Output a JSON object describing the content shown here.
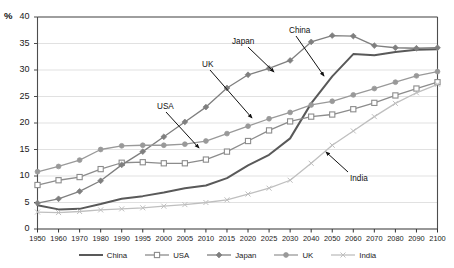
{
  "chart_data": {
    "type": "line",
    "title": "",
    "subtitle": "",
    "xlabel": "",
    "ylabel": "%",
    "ylim": [
      0,
      40
    ],
    "yticks": [
      0,
      5,
      10,
      15,
      20,
      25,
      30,
      35,
      40
    ],
    "grid": true,
    "legend_position": "bottom",
    "categories": [
      "1950",
      "1960",
      "1970",
      "1980",
      "1990",
      "1995",
      "2000",
      "2005",
      "2010",
      "2015",
      "2020",
      "2025",
      "2030",
      "2040",
      "2050",
      "2060",
      "2070",
      "2080",
      "2090",
      "2100"
    ],
    "series": [
      {
        "name": "China",
        "color": "#595959",
        "marker": "none",
        "values": [
          4.5,
          3.7,
          3.8,
          4.7,
          5.7,
          6.2,
          6.9,
          7.7,
          8.2,
          9.6,
          12.0,
          14.0,
          17.1,
          23.7,
          28.8,
          33.0,
          32.8,
          33.4,
          33.8,
          33.9
        ]
      },
      {
        "name": "USA",
        "color": "#8c8c8c",
        "marker": "open-square",
        "values": [
          8.3,
          9.2,
          9.8,
          11.3,
          12.5,
          12.6,
          12.4,
          12.4,
          13.1,
          14.6,
          16.6,
          18.6,
          20.3,
          21.2,
          21.6,
          22.6,
          23.8,
          25.2,
          26.5,
          27.7
        ]
      },
      {
        "name": "Japan",
        "color": "#7f7f7f",
        "marker": "filled-diamond",
        "values": [
          4.9,
          5.7,
          7.1,
          9.1,
          12.1,
          14.6,
          17.4,
          20.2,
          23.0,
          26.6,
          29.1,
          30.3,
          31.8,
          35.3,
          36.5,
          36.4,
          34.6,
          34.2,
          34.1,
          34.2
        ]
      },
      {
        "name": "UK",
        "color": "#999999",
        "marker": "filled-circle",
        "values": [
          10.8,
          11.8,
          13.0,
          15.0,
          15.7,
          15.8,
          15.8,
          16.0,
          16.6,
          18.0,
          19.4,
          20.8,
          22.0,
          23.4,
          24.1,
          25.3,
          26.5,
          27.7,
          28.9,
          29.7
        ]
      },
      {
        "name": "India",
        "color": "#bfbfbf",
        "marker": "cross",
        "values": [
          3.2,
          3.1,
          3.3,
          3.6,
          3.8,
          4.0,
          4.3,
          4.6,
          5.0,
          5.5,
          6.6,
          7.7,
          9.2,
          12.4,
          15.8,
          18.5,
          21.2,
          23.7,
          25.7,
          27.3
        ]
      }
    ],
    "annotations": [
      {
        "label": "China",
        "x": 289,
        "y": 26,
        "arrow_from": [
          296,
          36
        ],
        "arrow_to": [
          324,
          76
        ]
      },
      {
        "label": "Japan",
        "x": 232,
        "y": 37,
        "arrow_from": [
          248,
          47
        ],
        "arrow_to": [
          274,
          72
        ]
      },
      {
        "label": "UK",
        "x": 202,
        "y": 60,
        "arrow_from": [
          210,
          70
        ],
        "arrow_to": [
          252,
          118
        ]
      },
      {
        "label": "USA",
        "x": 157,
        "y": 102,
        "arrow_from": [
          166,
          112
        ],
        "arrow_to": [
          199,
          148
        ]
      },
      {
        "label": "India",
        "x": 350,
        "y": 174,
        "arrow_from": [
          348,
          172
        ],
        "arrow_to": [
          326,
          152
        ]
      }
    ]
  },
  "legend": {
    "entries": [
      {
        "label": "China",
        "icon": "line-swatch-icon"
      },
      {
        "label": "USA",
        "icon": "line-open-square-swatch-icon"
      },
      {
        "label": "Japan",
        "icon": "line-diamond-swatch-icon"
      },
      {
        "label": "UK",
        "icon": "line-circle-swatch-icon"
      },
      {
        "label": "India",
        "icon": "line-cross-swatch-icon"
      }
    ]
  }
}
